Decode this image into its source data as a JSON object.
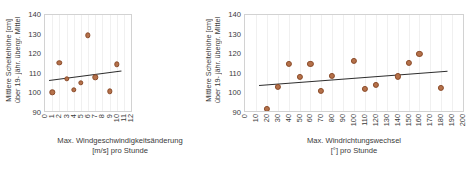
{
  "chart_data": [
    {
      "id": "left",
      "type": "scatter",
      "title": "",
      "xlabel": "Max. Windgeschwindigkeitsänderung [m/s] pro Stunde",
      "xlabel_line1": "Max. Windgeschwindigkeitsänderung",
      "xlabel_line2": "[m/s] pro Stunde",
      "ylabel": "Mittlere Scheitelhöhe [cm] über 19-jähr. übergr. Mittel",
      "ylabel_line1": "Mittlere Scheitelhöhe [cm]",
      "ylabel_line2": "über 19- jähr. übergr. Mittel",
      "xlim": [
        0,
        12
      ],
      "ylim": [
        90,
        140
      ],
      "xticks": [
        0,
        1,
        2,
        3,
        4,
        5,
        6,
        7,
        8,
        9,
        10,
        11,
        12
      ],
      "yticks": [
        90,
        100,
        110,
        120,
        130,
        140
      ],
      "grid": "vertical",
      "legend": "none",
      "marker_color": "#b5714a",
      "marker_edge_color": "#8a4a28",
      "trend_color": "#2e2e2e",
      "x": [
        1,
        2,
        3,
        4,
        5,
        6,
        7,
        9,
        10
      ],
      "y": [
        99.7,
        115.0,
        106.7,
        101.1,
        104.8,
        129.5,
        107.6,
        100.2,
        114.4
      ],
      "trendline": {
        "x0": 0.55,
        "y0": 106.3,
        "x1": 10.6,
        "y1": 111.2
      }
    },
    {
      "id": "right",
      "type": "scatter",
      "title": "",
      "xlabel": "Max. Windrichtungswechsel [°] pro Stunde",
      "xlabel_line1": "Max. Windrichtungswechsel",
      "xlabel_line2": "[°] pro Stunde",
      "ylabel": "Mittlere Scheitelhöhe [cm] über 19-jähr. übergr. Mittel",
      "ylabel_line1": "Mittlere Scheitelhöhe [cm]",
      "ylabel_line2": "über 19- jähr. übergr. Mittel",
      "xlim": [
        0,
        200
      ],
      "ylim": [
        90,
        140
      ],
      "xticks": [
        0,
        10,
        20,
        30,
        40,
        50,
        60,
        70,
        80,
        90,
        100,
        110,
        120,
        130,
        140,
        150,
        160,
        170,
        180,
        190,
        200
      ],
      "yticks": [
        90,
        100,
        110,
        120,
        130,
        140
      ],
      "grid": "vertical",
      "legend": "none",
      "marker_color": "#b5714a",
      "marker_edge_color": "#8a4a28",
      "trend_color": "#2e2e2e",
      "x": [
        20,
        30,
        40,
        50,
        60,
        70,
        80,
        100,
        110,
        120,
        140,
        150,
        160,
        180
      ],
      "y": [
        91.0,
        102.4,
        114.6,
        107.7,
        114.6,
        100.3,
        108.4,
        116.2,
        101.4,
        103.4,
        108.0,
        115.2,
        119.8,
        102.2
      ],
      "trendline": {
        "x0": 13,
        "y0": 103.6,
        "x1": 186,
        "y1": 111.0
      }
    }
  ]
}
